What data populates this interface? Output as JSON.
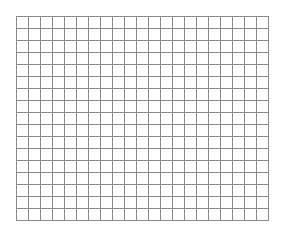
{
  "grid": {
    "columns": 21,
    "rows": 17,
    "cell_size": 12,
    "line_color": "#8a8a8a",
    "background": "#ffffff"
  }
}
